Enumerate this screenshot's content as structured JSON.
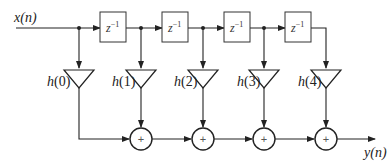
{
  "diagram": {
    "type": "FIR filter direct form block diagram",
    "input_label": "x(n)",
    "output_label": "y(n)",
    "delays": [
      {
        "label": "z",
        "exp": "−1"
      },
      {
        "label": "z",
        "exp": "−1"
      },
      {
        "label": "z",
        "exp": "−1"
      },
      {
        "label": "z",
        "exp": "−1"
      }
    ],
    "coefficients": [
      "h(0)",
      "h(1)",
      "h(2)",
      "h(3)",
      "h(4)"
    ],
    "adders": [
      "+",
      "+",
      "+",
      "+"
    ],
    "colors": {
      "stroke": "#222222",
      "background": "#ffffff"
    }
  }
}
